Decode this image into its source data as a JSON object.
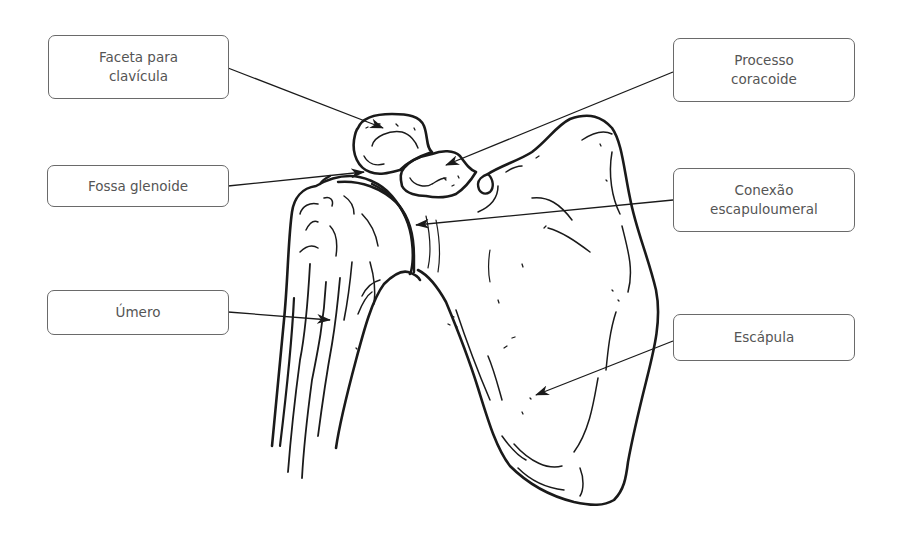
{
  "diagram": {
    "colors": {
      "line": "#1a1a1a",
      "box_border": "#6a6a6a",
      "label_text": "#555555",
      "background": "#ffffff"
    }
  },
  "labels": {
    "faceta_clavicula": {
      "text": "Faceta para\nclavícula",
      "side": "left"
    },
    "fossa_glenoide": {
      "text": "Fossa glenoide",
      "side": "left"
    },
    "umero": {
      "text": "Úmero",
      "side": "left"
    },
    "processo_coracoide": {
      "text": "Processo\ncoracoide",
      "side": "right"
    },
    "conexao_escapuloumeral": {
      "text": "Conexão\nescapuloumeral",
      "side": "right"
    },
    "escapula": {
      "text": "Escápula",
      "side": "right"
    }
  }
}
